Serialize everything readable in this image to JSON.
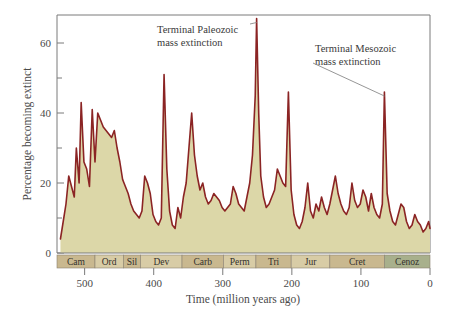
{
  "chart_data": {
    "type": "area",
    "title": "",
    "xlabel": "Time (million years ago)",
    "ylabel": "Percentage becoming extinct",
    "xlim": [
      540,
      0
    ],
    "ylim": [
      0,
      68
    ],
    "x_ticks": [
      500,
      400,
      300,
      200,
      100,
      0
    ],
    "x_tick_labels": [
      "500",
      "400",
      "300",
      "200",
      "100",
      "0"
    ],
    "y_ticks": [
      0,
      20,
      40,
      60
    ],
    "y_tick_labels": [
      "0",
      "20",
      "40",
      "60"
    ],
    "y_minor_ticks": [
      10,
      30,
      50
    ],
    "grid": false,
    "legend": "none",
    "x_reversed": true,
    "line_color": "#8b2424",
    "fill_color": "#dcd7a8",
    "series_name": "Percentage of genera becoming extinct",
    "x": [
      535,
      531,
      527,
      523,
      519,
      515,
      512,
      508,
      505,
      501,
      497,
      493,
      489,
      485,
      481,
      477,
      473,
      469,
      465,
      461,
      457,
      453,
      449,
      445,
      441,
      437,
      433,
      429,
      425,
      421,
      417,
      413,
      409,
      405,
      401,
      397,
      393,
      389,
      385,
      381,
      377,
      373,
      369,
      365,
      361,
      357,
      353,
      349,
      345,
      341,
      337,
      333,
      329,
      325,
      321,
      317,
      313,
      309,
      305,
      301,
      297,
      293,
      289,
      285,
      281,
      277,
      273,
      269,
      265,
      261,
      257,
      253,
      251,
      248,
      245,
      241,
      237,
      233,
      229,
      225,
      221,
      217,
      213,
      209,
      205,
      201,
      197,
      193,
      189,
      185,
      181,
      177,
      173,
      169,
      165,
      161,
      157,
      153,
      149,
      145,
      141,
      137,
      133,
      129,
      125,
      121,
      117,
      113,
      109,
      105,
      101,
      97,
      93,
      89,
      85,
      81,
      77,
      73,
      69,
      66,
      62,
      58,
      54,
      50,
      46,
      42,
      38,
      34,
      30,
      26,
      22,
      18,
      14,
      10,
      6,
      2,
      0
    ],
    "values": [
      4,
      9,
      14,
      22,
      19,
      16,
      30,
      20,
      43,
      26,
      24,
      19,
      41,
      26,
      40,
      38,
      36,
      35,
      34,
      33,
      35,
      30,
      26,
      21,
      19,
      17,
      14,
      12,
      11,
      10,
      12,
      22,
      20,
      17,
      11,
      9,
      8,
      10,
      51,
      24,
      12,
      8,
      7,
      13,
      10,
      16,
      20,
      30,
      40,
      28,
      22,
      18,
      20,
      16,
      14,
      15,
      17,
      16,
      15,
      13,
      12,
      13,
      14,
      19,
      17,
      14,
      13,
      12,
      16,
      20,
      28,
      45,
      67,
      40,
      22,
      16,
      13,
      14,
      16,
      18,
      24,
      22,
      20,
      19,
      46,
      18,
      11,
      8,
      7,
      9,
      13,
      20,
      12,
      10,
      14,
      12,
      16,
      13,
      11,
      14,
      18,
      22,
      17,
      14,
      12,
      11,
      13,
      20,
      15,
      13,
      14,
      18,
      16,
      12,
      17,
      13,
      11,
      10,
      14,
      46,
      17,
      12,
      9,
      8,
      11,
      14,
      13,
      9,
      7,
      8,
      11,
      9,
      8,
      6,
      7,
      9,
      7
    ],
    "periods": [
      {
        "name": "Cam",
        "start": 541,
        "end": 485,
        "color": "#c9b88f"
      },
      {
        "name": "Ord",
        "start": 485,
        "end": 444,
        "color": "#d8cca6"
      },
      {
        "name": "Sil",
        "start": 444,
        "end": 419,
        "color": "#c9b88f"
      },
      {
        "name": "Dev",
        "start": 419,
        "end": 359,
        "color": "#d8cca6"
      },
      {
        "name": "Carb",
        "start": 359,
        "end": 299,
        "color": "#c9b88f"
      },
      {
        "name": "Perm",
        "start": 299,
        "end": 252,
        "color": "#d8cca6"
      },
      {
        "name": "Tri",
        "start": 252,
        "end": 201,
        "color": "#c9b88f"
      },
      {
        "name": "Jur",
        "start": 201,
        "end": 145,
        "color": "#d8cca6"
      },
      {
        "name": "Cret",
        "start": 145,
        "end": 66,
        "color": "#c9b88f"
      },
      {
        "name": "Cenoz",
        "start": 66,
        "end": 0,
        "color": "#a8b08c"
      }
    ],
    "annotations": [
      {
        "id": "terminal-paleozoic",
        "line1": "Terminal Paleozoic",
        "line2": "mass extinction",
        "target_x": 251,
        "target_y": 67
      },
      {
        "id": "terminal-mesozoic",
        "line1": "Terminal Mesozoic",
        "line2": "mass extinction",
        "target_x": 66,
        "target_y": 46
      }
    ]
  }
}
